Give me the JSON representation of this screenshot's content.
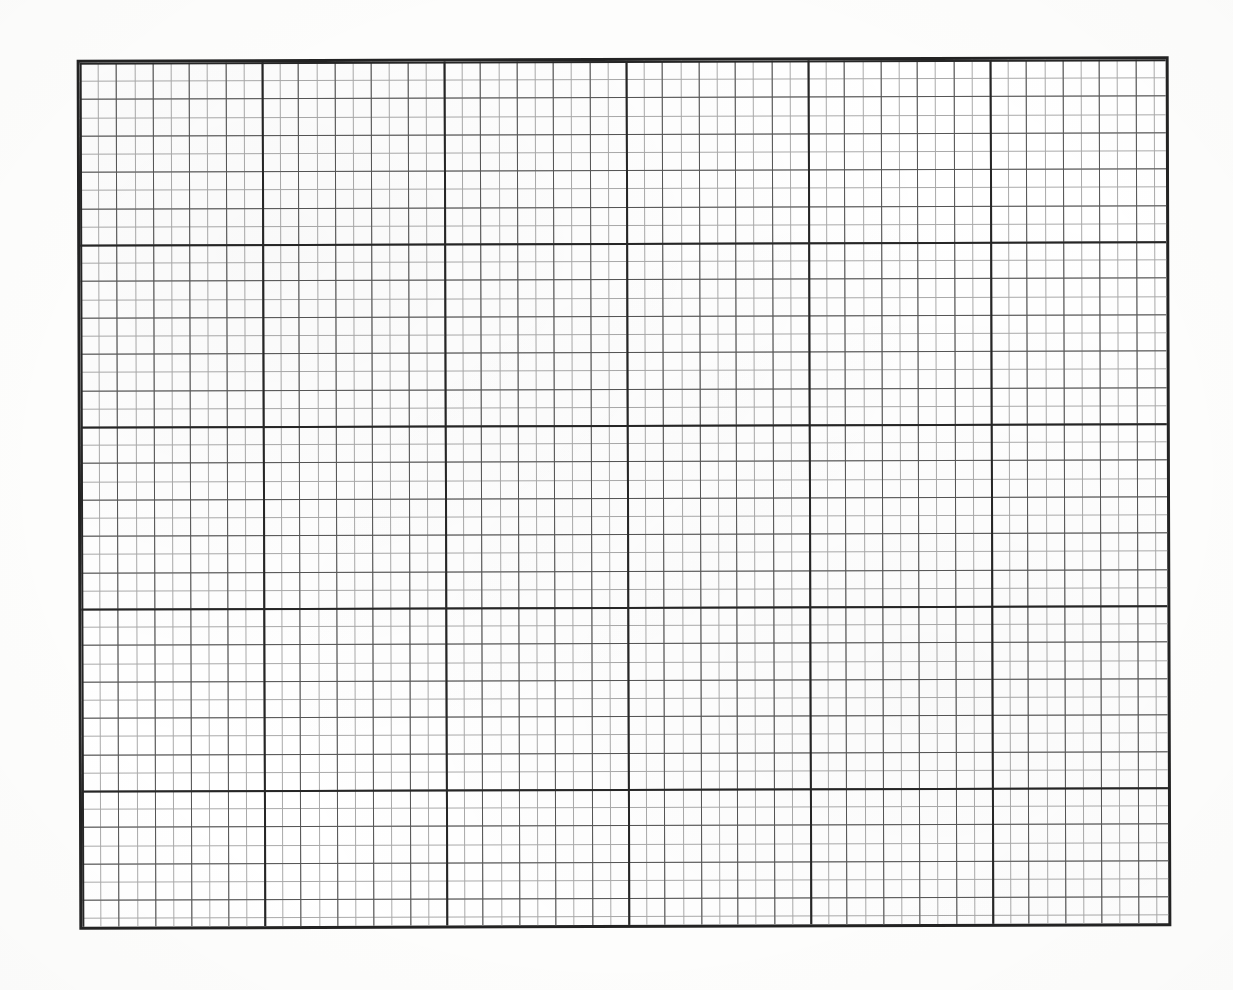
{
  "document": {
    "kind": "graph-paper-sheet",
    "title": "Blank Graph Paper",
    "background_color": "#fdfdfc",
    "paper_color": "#ffffff"
  },
  "grid": {
    "left": 78,
    "top": 58,
    "width": 1092,
    "height": 870,
    "border_color": "#232323",
    "border_width": 3,
    "cell_size": 18.2,
    "columns": 60,
    "rows": 48,
    "minor_line_color": "#a9a9a9",
    "minor_line_width": 1,
    "mid_line_color": "#555555",
    "mid_line_width": 1,
    "major_line_color": "#262626",
    "major_line_width": 2,
    "major_every": 10,
    "mid_every": 2,
    "skew_degrees": -0.18
  },
  "chart_data": {
    "type": "table",
    "xlabel": "",
    "ylabel": "",
    "categories": [],
    "values": [],
    "grid": true,
    "legend_position": "none",
    "xlim": [
      0,
      60
    ],
    "ylim": [
      0,
      48
    ]
  }
}
